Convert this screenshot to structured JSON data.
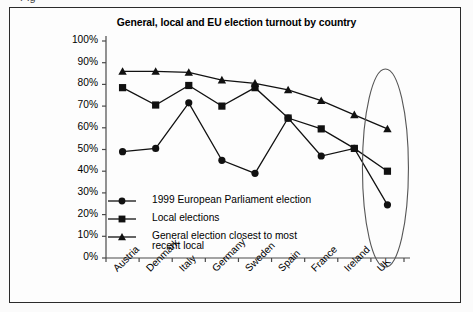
{
  "figure": {
    "cut_caption": "Fig",
    "title": "General, local and EU election turnout by country"
  },
  "chart_data": {
    "type": "line",
    "title": "General, local and EU election turnout by country",
    "xlabel": "",
    "ylabel": "",
    "ylim": [
      0,
      100
    ],
    "yticks": [
      "0%",
      "10%",
      "20%",
      "30%",
      "40%",
      "50%",
      "60%",
      "70%",
      "80%",
      "90%",
      "100%"
    ],
    "grid": false,
    "legend_position": "inside-lower-left",
    "categories": [
      "Austria",
      "Denmark",
      "Italy",
      "Germany",
      "Sweden",
      "Spain",
      "France",
      "Ireland",
      "UK"
    ],
    "series": [
      {
        "name": "1999 European Parliament election",
        "marker": "circle",
        "values": [
          49,
          50.5,
          71.5,
          45,
          39,
          64.5,
          47,
          50.5,
          24.5
        ]
      },
      {
        "name": "Local elections",
        "marker": "square",
        "values": [
          78.5,
          70.5,
          79.5,
          70,
          78.5,
          64.5,
          59.5,
          50.5,
          40
        ]
      },
      {
        "name": "General election closest to most recent local",
        "marker": "triangle",
        "values": [
          86,
          86,
          85.5,
          82,
          80.5,
          77.5,
          72.5,
          66,
          59.5
        ]
      }
    ],
    "annotations": [
      {
        "type": "ellipse-highlight",
        "target": "UK",
        "description": "Oval drawn around the UK data points and label"
      }
    ]
  },
  "colors": {
    "line": "#111111",
    "frame": "#2b2b2b",
    "axis": "#4a4a4a",
    "background": "#fdfdfd"
  }
}
